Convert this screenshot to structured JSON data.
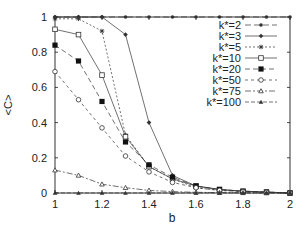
{
  "chart_data": {
    "type": "line",
    "title": "",
    "xlabel": "b",
    "ylabel": "<C>",
    "xlim": [
      1,
      2
    ],
    "ylim": [
      0,
      1
    ],
    "x_ticks": [
      "1",
      "1.2",
      "1.4",
      "1.6",
      "1.8",
      "2"
    ],
    "y_ticks": [
      "0",
      "0.2",
      "0.4",
      "0.6",
      "0.8",
      "1"
    ],
    "grid": false,
    "legend_position": "upper right",
    "x": [
      1.0,
      1.1,
      1.2,
      1.3,
      1.4,
      1.5,
      1.6,
      1.7,
      1.8,
      1.9,
      2.0
    ],
    "series": [
      {
        "name": "k*=2",
        "marker": "filled-circle-small",
        "dash": "6,3",
        "values": [
          1.0,
          1.0,
          1.0,
          1.0,
          1.0,
          1.0,
          1.0,
          1.0,
          1.0,
          1.0,
          1.0
        ]
      },
      {
        "name": "k*=3",
        "marker": "filled-diamond",
        "dash": "",
        "values": [
          1.0,
          1.0,
          1.0,
          0.9,
          0.4,
          0.1,
          0.04,
          0.02,
          0.01,
          0.005,
          0.0
        ]
      },
      {
        "name": "k*=5",
        "marker": "star",
        "dash": "2,2",
        "values": [
          0.99,
          0.99,
          0.92,
          0.33,
          0.15,
          0.08,
          0.03,
          0.015,
          0.01,
          0.005,
          0.0
        ]
      },
      {
        "name": "k*=10",
        "marker": "open-square",
        "dash": "",
        "values": [
          0.93,
          0.9,
          0.67,
          0.32,
          0.15,
          0.08,
          0.04,
          0.02,
          0.01,
          0.005,
          0.0
        ]
      },
      {
        "name": "k*=20",
        "marker": "filled-square",
        "dash": "5,3",
        "values": [
          0.84,
          0.75,
          0.52,
          0.29,
          0.16,
          0.09,
          0.04,
          0.02,
          0.01,
          0.005,
          0.0
        ]
      },
      {
        "name": "k*=50",
        "marker": "open-circle",
        "dash": "3,3",
        "values": [
          0.69,
          0.53,
          0.37,
          0.21,
          0.12,
          0.06,
          0.03,
          0.015,
          0.008,
          0.004,
          0.0
        ]
      },
      {
        "name": "k*=75",
        "marker": "open-triangle",
        "dash": "6,2,2,2",
        "values": [
          0.13,
          0.1,
          0.05,
          0.03,
          0.015,
          0.008,
          0.004,
          0.002,
          0.001,
          0.0,
          0.0
        ]
      },
      {
        "name": "k*=100",
        "marker": "filled-triangle",
        "dash": "4,2",
        "values": [
          0.0,
          0.0,
          0.0,
          0.0,
          0.0,
          0.0,
          0.0,
          0.0,
          0.0,
          0.0,
          0.0
        ]
      }
    ]
  },
  "colors": {
    "line": "#333333",
    "axis": "#000000",
    "background": "#ffffff"
  }
}
